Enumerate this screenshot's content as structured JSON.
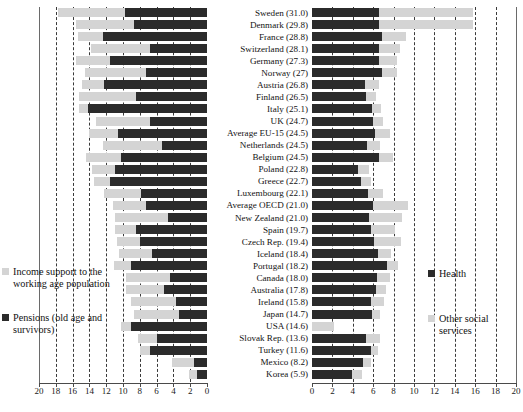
{
  "chart_data": {
    "type": "bar",
    "title": "",
    "layout": "two-panel diverging horizontal stacked bars sharing centered category labels",
    "panels": [
      {
        "id": "left",
        "orientation": "right-to-left",
        "xlabel": "",
        "ylabel": "",
        "xlim": [
          20,
          0
        ],
        "xticks": [
          20,
          18,
          16,
          14,
          12,
          10,
          8,
          6,
          4,
          2,
          0
        ],
        "grid": true,
        "series": [
          {
            "name": "Pensions (old age and survivors)",
            "color": "#2b2b2b",
            "values": [
              9.8,
              8.7,
              12.4,
              6.8,
              11.6,
              7.3,
              12.3,
              8.5,
              14.2,
              6.8,
              10.6,
              5.4,
              10.2,
              10.9,
              11.6,
              7.8,
              7.3,
              4.7,
              8.5,
              8.0,
              6.5,
              9.1,
              4.4,
              5.1,
              3.7,
              3.3,
              9.0,
              5.9,
              6.8,
              1.6,
              1.2,
              1.4
            ]
          },
          {
            "name": "Income support to the working age population",
            "color": "#d4d4d4",
            "values": [
              8.0,
              6.9,
              3.0,
              7.0,
              4.0,
              7.2,
              2.6,
              6.8,
              1.1,
              6.4,
              3.5,
              7.0,
              4.2,
              2.8,
              1.9,
              4.5,
              3.9,
              6.3,
              2.4,
              2.7,
              4.0,
              2.0,
              5.3,
              4.6,
              5.3,
              5.4,
              1.3,
              2.3,
              1.2,
              2.6,
              0.9,
              0.7
            ]
          }
        ]
      },
      {
        "id": "right",
        "orientation": "left-to-right",
        "xlabel": "",
        "ylabel": "",
        "xlim": [
          0,
          20
        ],
        "xticks": [
          0,
          2,
          4,
          6,
          8,
          10,
          12,
          14,
          16,
          18,
          20
        ],
        "grid": true,
        "series": [
          {
            "name": "Health",
            "color": "#2b2b2b",
            "values": [
              6.6,
              6.6,
              6.9,
              6.6,
              6.6,
              6.9,
              5.2,
              5.3,
              5.9,
              6.0,
              6.2,
              5.4,
              6.6,
              4.5,
              4.8,
              5.5,
              6.0,
              5.6,
              5.8,
              6.1,
              6.5,
              7.4,
              6.4,
              6.3,
              5.8,
              5.9,
              0.0,
              5.3,
              5.8,
              5.0,
              3.9,
              3.1
            ]
          },
          {
            "name": "Other social services",
            "color": "#d4d4d4",
            "values": [
              9.2,
              9.2,
              2.3,
              2.0,
              1.7,
              1.4,
              1.4,
              1.0,
              0.9,
              1.0,
              1.4,
              1.3,
              1.3,
              1.1,
              1.0,
              1.5,
              3.4,
              3.2,
              2.3,
              2.6,
              1.2,
              1.0,
              1.2,
              1.0,
              1.3,
              0.8,
              2.2,
              1.4,
              0.7,
              0.8,
              1.0,
              1.0
            ]
          }
        ]
      }
    ],
    "categories": [
      "Sweden (31.0)",
      "Denmark (29.8)",
      "France (28.8)",
      "Switzerland (28.1)",
      "Germany (27.3)",
      "Norway (27)",
      "Austria (26.8)",
      "Finland (26.5)",
      "Italy (25.1)",
      "UK (24.7)",
      "Average EU-15 (24.5)",
      "Netherlands (24.5)",
      "Belgium (24.5)",
      "Poland (22.8)",
      "Greece (22.7)",
      "Luxembourg (22.1)",
      "Average OECD (21.0)",
      "New Zealand (21.0)",
      "Spain (19.7)",
      "Czech Rep. (19.4)",
      "Iceland (18.4)",
      "Portugal (18.2)",
      "Canada (18.0)",
      "Australia (17.8)",
      "Ireland (15.8)",
      "Japan (14.7)",
      "USA (14.6)",
      "Slovak Rep. (13.6)",
      "Turkey (11.6)",
      "Mexico (8.2)",
      "Korea (5.9)"
    ]
  },
  "left_panel": {
    "tick_labels": [
      "20",
      "18",
      "16",
      "14",
      "12",
      "10",
      "8",
      "6",
      "4",
      "2",
      "0"
    ],
    "legend": {
      "items": [
        {
          "label": "Income support to the working age population",
          "swatch": "light"
        },
        {
          "label": "Pensions (old age and survivors)",
          "swatch": "dark"
        }
      ]
    }
  },
  "right_panel": {
    "tick_labels": [
      "0",
      "2",
      "4",
      "6",
      "8",
      "10",
      "12",
      "14",
      "16",
      "18",
      "20"
    ],
    "legend": {
      "items": [
        {
          "label": "Health",
          "swatch": "dark"
        },
        {
          "label": "Other social services",
          "swatch": "light"
        }
      ]
    }
  },
  "colors": {
    "dark": "#2b2b2b",
    "light": "#d4d4d4",
    "grid": "#3a3a3a",
    "axis": "#4a4a4a"
  }
}
